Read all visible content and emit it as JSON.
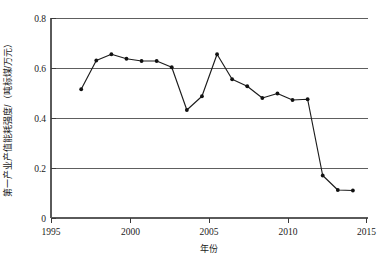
{
  "chart_data": {
    "type": "line",
    "title": "",
    "xlabel": "年份",
    "ylabel": "第一产业产值能耗强度/（吨标煤/万元）",
    "xlim": [
      1995,
      2016
    ],
    "ylim": [
      0,
      0.8
    ],
    "xticks": [
      "1995",
      "2000",
      "2005",
      "2010",
      "2015"
    ],
    "xtick_values": [
      1995,
      2000,
      2005,
      2010,
      2015
    ],
    "yticks": [
      "0",
      "0.2",
      "0.4",
      "0.6",
      "0.8"
    ],
    "ytick_values": [
      0,
      0.2,
      0.4,
      0.6,
      0.8
    ],
    "grid": "horizontal",
    "legend": "none",
    "x": [
      1997,
      1998,
      1999,
      2000,
      2001,
      2002,
      2003,
      2004,
      2005,
      2006,
      2007,
      2008,
      2009,
      2010,
      2011,
      2012,
      2013,
      2014,
      2015
    ],
    "values": [
      0.515,
      0.63,
      0.655,
      0.637,
      0.628,
      0.628,
      0.603,
      0.432,
      0.487,
      0.655,
      0.555,
      0.527,
      0.48,
      0.498,
      0.472,
      0.475,
      0.17,
      0.112,
      0.11
    ],
    "series": [
      {
        "name": "第一产业产值能耗强度",
        "marker": "filled-circle",
        "color": "#111111",
        "values": [
          0.515,
          0.63,
          0.655,
          0.637,
          0.628,
          0.628,
          0.603,
          0.432,
          0.487,
          0.655,
          0.555,
          0.527,
          0.48,
          0.498,
          0.472,
          0.475,
          0.17,
          0.112,
          0.11
        ]
      }
    ]
  },
  "colors": {
    "line": "#111111",
    "grid": "#4d4d4d",
    "axis": "#5a5a5a",
    "text": "#1a1a1a",
    "background": "#ffffff"
  }
}
